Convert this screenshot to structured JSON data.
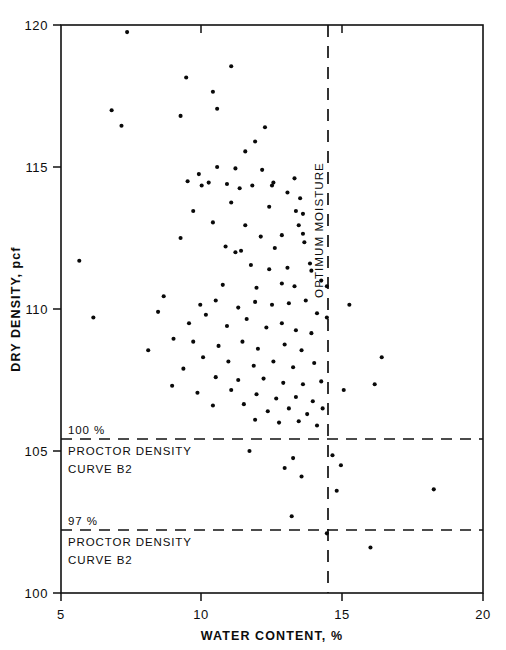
{
  "figure": {
    "background_color": "#ffffff",
    "ink_color": "#0d0d0d"
  },
  "axes": {
    "x_title": "WATER CONTENT, %",
    "y_title": "DRY DENSITY, pcf",
    "x_ticks": [
      "5",
      "10",
      "15",
      "20"
    ],
    "y_ticks": [
      "120",
      "115",
      "110",
      "105",
      "100"
    ]
  },
  "annotations": {
    "optimum_moisture": "OPTIMUM MOISTURE",
    "line_100_pct": "100 %",
    "line_100_label_1": "PROCTOR DENSITY",
    "line_100_label_2": "CURVE B2",
    "line_97_pct": "97 %",
    "line_97_label_1": "PROCTOR DENSITY",
    "line_97_label_2": "CURVE B2"
  },
  "chart_data": {
    "type": "scatter",
    "title": "",
    "xlabel": "WATER CONTENT, %",
    "ylabel": "DRY DENSITY, pcf",
    "xlim": [
      5,
      20
    ],
    "ylim": [
      100,
      120
    ],
    "xticks": [
      5,
      10,
      15,
      20
    ],
    "yticks": [
      100,
      105,
      110,
      115,
      120
    ],
    "grid": false,
    "legend": null,
    "reference_lines": [
      {
        "name": "optimum-moisture",
        "orientation": "vertical",
        "x": 14.45,
        "style": "dashed",
        "label": "OPTIMUM MOISTURE"
      },
      {
        "name": "100-percent-proctor-density-curve-b2",
        "orientation": "horizontal",
        "y": 105.4,
        "style": "dashed",
        "label": "100 % PROCTOR DENSITY CURVE B2"
      },
      {
        "name": "97-percent-proctor-density-curve-b2",
        "orientation": "horizontal",
        "y": 102.2,
        "style": "dashed",
        "label": "97 % PROCTOR DENSITY CURVE B2"
      }
    ],
    "series": [
      {
        "name": "field density tests",
        "marker": "dot",
        "color": "#090909",
        "points": [
          [
            7.35,
            119.75
          ],
          [
            6.8,
            117.0
          ],
          [
            7.15,
            116.45
          ],
          [
            9.45,
            118.15
          ],
          [
            10.4,
            117.65
          ],
          [
            11.05,
            118.55
          ],
          [
            10.55,
            117.05
          ],
          [
            9.25,
            116.8
          ],
          [
            11.9,
            115.9
          ],
          [
            12.25,
            116.4
          ],
          [
            11.55,
            115.55
          ],
          [
            10.55,
            115.0
          ],
          [
            11.2,
            114.95
          ],
          [
            12.15,
            114.9
          ],
          [
            9.9,
            114.75
          ],
          [
            9.5,
            114.5
          ],
          [
            10.0,
            114.35
          ],
          [
            10.25,
            114.45
          ],
          [
            10.9,
            114.4
          ],
          [
            11.8,
            114.35
          ],
          [
            12.5,
            114.35
          ],
          [
            12.55,
            114.45
          ],
          [
            11.35,
            114.25
          ],
          [
            13.3,
            114.6
          ],
          [
            13.05,
            114.1
          ],
          [
            13.5,
            113.9
          ],
          [
            9.7,
            113.45
          ],
          [
            11.05,
            113.75
          ],
          [
            12.4,
            113.6
          ],
          [
            13.35,
            113.45
          ],
          [
            13.6,
            113.35
          ],
          [
            10.4,
            113.05
          ],
          [
            11.55,
            112.95
          ],
          [
            12.1,
            112.55
          ],
          [
            12.85,
            112.6
          ],
          [
            13.45,
            112.95
          ],
          [
            13.6,
            112.65
          ],
          [
            13.65,
            112.35
          ],
          [
            9.25,
            112.5
          ],
          [
            10.85,
            112.2
          ],
          [
            11.2,
            112.0
          ],
          [
            11.4,
            112.05
          ],
          [
            12.6,
            112.15
          ],
          [
            5.65,
            111.7
          ],
          [
            11.75,
            111.55
          ],
          [
            12.4,
            111.4
          ],
          [
            13.05,
            111.45
          ],
          [
            13.85,
            111.6
          ],
          [
            13.9,
            111.35
          ],
          [
            10.75,
            110.85
          ],
          [
            11.95,
            110.75
          ],
          [
            12.85,
            110.9
          ],
          [
            13.3,
            110.8
          ],
          [
            14.25,
            111.0
          ],
          [
            14.45,
            110.8
          ],
          [
            6.15,
            109.7
          ],
          [
            8.65,
            110.45
          ],
          [
            9.95,
            110.15
          ],
          [
            10.5,
            110.3
          ],
          [
            11.3,
            110.05
          ],
          [
            11.9,
            110.25
          ],
          [
            12.5,
            110.15
          ],
          [
            13.1,
            110.2
          ],
          [
            13.7,
            110.3
          ],
          [
            14.1,
            109.85
          ],
          [
            14.45,
            109.7
          ],
          [
            15.25,
            110.15
          ],
          [
            8.45,
            109.9
          ],
          [
            9.55,
            109.5
          ],
          [
            10.15,
            109.8
          ],
          [
            10.9,
            109.4
          ],
          [
            11.6,
            109.65
          ],
          [
            12.3,
            109.35
          ],
          [
            12.85,
            109.5
          ],
          [
            13.35,
            109.25
          ],
          [
            13.9,
            109.15
          ],
          [
            9.0,
            108.95
          ],
          [
            9.7,
            108.85
          ],
          [
            10.6,
            108.7
          ],
          [
            11.45,
            108.85
          ],
          [
            12.0,
            108.6
          ],
          [
            12.95,
            108.75
          ],
          [
            13.55,
            108.55
          ],
          [
            8.1,
            108.55
          ],
          [
            10.05,
            108.3
          ],
          [
            10.95,
            108.15
          ],
          [
            11.85,
            108.0
          ],
          [
            12.55,
            108.15
          ],
          [
            13.25,
            107.95
          ],
          [
            14.0,
            108.1
          ],
          [
            9.35,
            107.9
          ],
          [
            10.5,
            107.6
          ],
          [
            11.3,
            107.5
          ],
          [
            12.2,
            107.55
          ],
          [
            12.9,
            107.4
          ],
          [
            13.6,
            107.35
          ],
          [
            14.25,
            107.45
          ],
          [
            8.95,
            107.3
          ],
          [
            9.85,
            107.05
          ],
          [
            11.05,
            107.15
          ],
          [
            11.95,
            107.0
          ],
          [
            12.65,
            106.85
          ],
          [
            13.35,
            106.9
          ],
          [
            13.95,
            106.75
          ],
          [
            10.4,
            106.6
          ],
          [
            11.5,
            106.65
          ],
          [
            12.35,
            106.4
          ],
          [
            13.1,
            106.5
          ],
          [
            13.75,
            106.3
          ],
          [
            14.3,
            106.5
          ],
          [
            11.9,
            106.1
          ],
          [
            12.75,
            106.0
          ],
          [
            13.45,
            106.05
          ],
          [
            14.1,
            105.9
          ],
          [
            15.05,
            107.15
          ],
          [
            16.4,
            108.3
          ],
          [
            16.15,
            107.35
          ],
          [
            11.7,
            105.0
          ],
          [
            13.25,
            104.75
          ],
          [
            12.95,
            104.4
          ],
          [
            13.55,
            104.1
          ],
          [
            14.65,
            104.85
          ],
          [
            14.95,
            104.5
          ],
          [
            14.8,
            103.6
          ],
          [
            18.25,
            103.65
          ],
          [
            13.2,
            102.7
          ],
          [
            14.45,
            102.1
          ],
          [
            16.0,
            101.6
          ]
        ]
      }
    ]
  }
}
